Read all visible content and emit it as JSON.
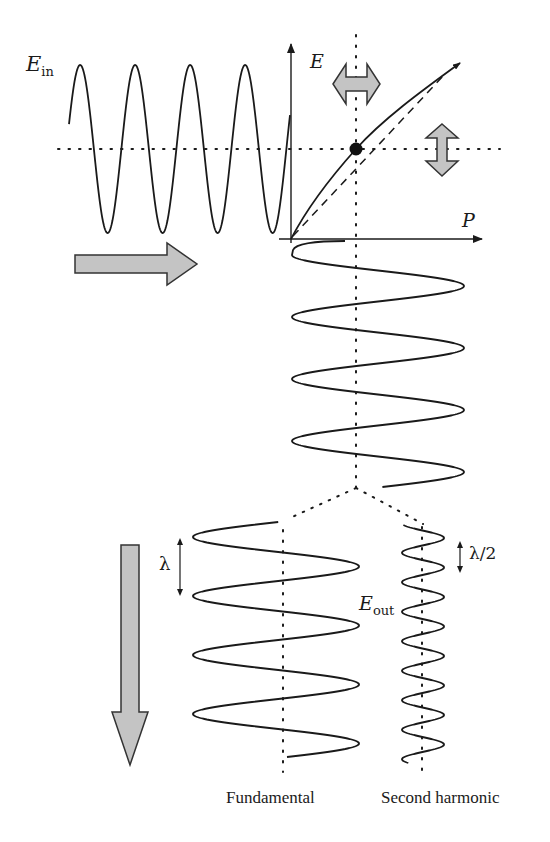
{
  "labels": {
    "e_in_main": "E",
    "e_in_sub": "in",
    "e_axis": "E",
    "p_axis": "P",
    "e_out_main": "E",
    "e_out_sub": "out",
    "lambda": "λ",
    "lambda_half": "λ/2",
    "fundamental": "Fundamental",
    "second_harmonic": "Second harmonic"
  },
  "colors": {
    "line": "#1a1a1a",
    "arrow_fill": "#c4c4c4",
    "arrow_stroke": "#333333",
    "background": "#ffffff"
  },
  "diagram": {
    "input_wave": {
      "cycles": 4.3,
      "axis_y": 149,
      "amplitude": 84
    },
    "output_wave": {
      "cycles": 4
    },
    "fundamental_wave": {
      "cycles": 4,
      "wavelength_label": "λ"
    },
    "second_harmonic_wave": {
      "cycles": 8,
      "wavelength_label": "λ/2"
    },
    "operating_point": {
      "x": 356,
      "y": 149
    }
  }
}
